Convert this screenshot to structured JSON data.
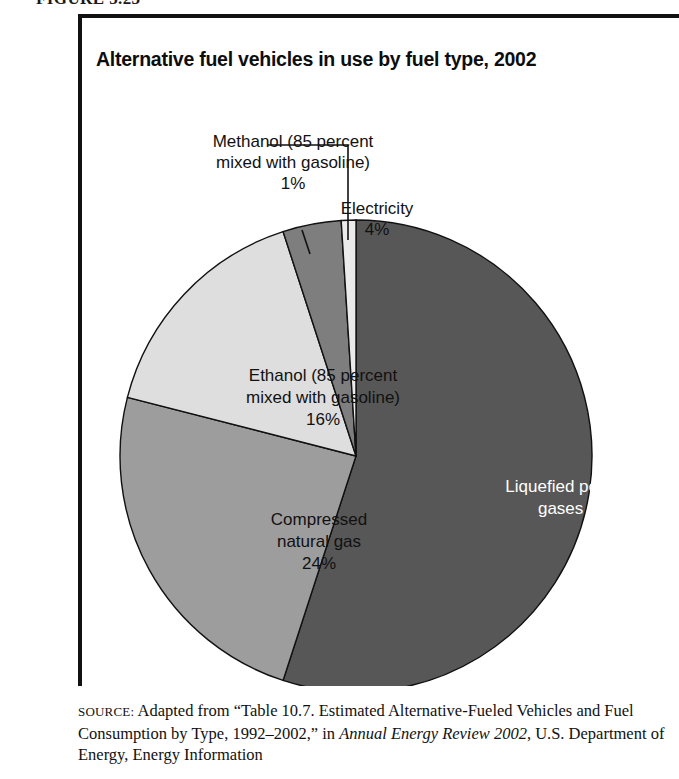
{
  "figure": {
    "number_label": "FIGURE 5.23",
    "title": "Alternative fuel vehicles in use by fuel type, 2002"
  },
  "chart_data": {
    "type": "pie",
    "title": "Alternative fuel vehicles in use by fuel type, 2002",
    "xlabel": "",
    "ylabel": "",
    "units": "percent of alternative fuel vehicles in use",
    "legend_position": "none (direct labels)",
    "grid": false,
    "start_angle_deg": 0,
    "direction": "clockwise",
    "categories": [
      "Liquefied petroleum gases",
      "Compressed natural gas",
      "Ethanol (85 percent mixed with gasoline)",
      "Electricity",
      "Methanol (85 percent mixed with gasoline)"
    ],
    "values": [
      55,
      24,
      16,
      4,
      1
    ],
    "slices": [
      {
        "key": "lpg",
        "name": "Liquefied petroleum gases",
        "value": 55,
        "value_label": "55%",
        "label_text": "Liquefied petroleum\ngases 55%",
        "label_placement": "inside",
        "color": "#575757",
        "text_color": "#ffffff",
        "start_deg": 0,
        "end_deg": 198
      },
      {
        "key": "cng",
        "name": "Compressed natural gas",
        "value": 24,
        "value_label": "24%",
        "label_text": "Compressed\nnatural gas\n24%",
        "label_placement": "inside",
        "color": "#9d9d9d",
        "text_color": "#111111",
        "start_deg": 198,
        "end_deg": 284.4
      },
      {
        "key": "ethanol",
        "name": "Ethanol (85 percent mixed with gasoline)",
        "value": 16,
        "value_label": "16%",
        "label_text": "Ethanol (85 percent\nmixed with gasoline)\n16%",
        "label_placement": "inside",
        "color": "#dedede",
        "text_color": "#111111",
        "start_deg": 284.4,
        "end_deg": 342
      },
      {
        "key": "electricity",
        "name": "Electricity",
        "value": 4,
        "value_label": "4%",
        "label_text": "Electricity\n4%",
        "label_placement": "callout",
        "color": "#7e7e7e",
        "text_color": "#111111",
        "start_deg": 342,
        "end_deg": 356.4
      },
      {
        "key": "methanol",
        "name": "Methanol (85 percent mixed with gasoline)",
        "value": 1,
        "value_label": "1%",
        "label_text": "Methanol (85 percent\nmixed with gasoline)\n1%",
        "label_placement": "callout",
        "color": "#ebebeb",
        "text_color": "#111111",
        "start_deg": 356.4,
        "end_deg": 360
      }
    ]
  },
  "labels": {
    "methanol": "Methanol (85 percent\nmixed with gasoline)\n1%",
    "electricity": "Electricity\n4%",
    "ethanol": "Ethanol (85 percent\nmixed with gasoline)\n16%",
    "cng": "Compressed\nnatural gas\n24%",
    "lpg": "Liquefied petroleum\ngases 55%"
  },
  "source": {
    "prefix": "SOURCE:",
    "line1_a": " Adapted from “Table 10.7. Estimated Alternative-Fueled",
    "line2_a": "Vehicles and Fuel Consumption by Type, 1992–2002,” in ",
    "line2_italic": "Annual",
    "line3_italic": "Energy Review 2002",
    "line3_b": ", U.S. Department of Energy, Energy Information"
  },
  "colors": {
    "frame": "#111111",
    "background": "#ffffff",
    "slice_outline": "#111111",
    "leader_line": "#111111"
  }
}
